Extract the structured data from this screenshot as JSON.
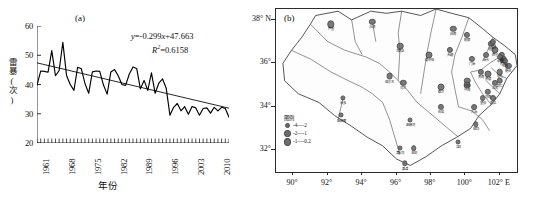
{
  "figure": {
    "panel_a_label": "(a)",
    "panel_b_label": "(b)"
  },
  "chart_data": [
    {
      "type": "line",
      "panel": "(a)",
      "title": "",
      "xlabel": "年份",
      "ylabel": "雷暴(次)",
      "xlim": [
        1961,
        2013
      ],
      "ylim": [
        20,
        60
      ],
      "yticks": [
        20,
        30,
        40,
        50,
        60
      ],
      "xticks": [
        1961,
        1968,
        1975,
        1982,
        1989,
        1996,
        2003,
        2010
      ],
      "grid": false,
      "legend": "none",
      "annotations": [
        {
          "name": "regression-equation",
          "text": "y=-0.299x+47.663"
        },
        {
          "name": "r-squared",
          "text": "R²=0.6158"
        }
      ],
      "trendline": {
        "slope": -0.299,
        "intercept": 47.663,
        "r2": 0.6158,
        "y_at_start": 47.4,
        "y_at_end": 31.9
      },
      "series": [
        {
          "name": "annual thunderstorm days",
          "x": [
            1961,
            1962,
            1963,
            1964,
            1965,
            1966,
            1967,
            1968,
            1969,
            1970,
            1971,
            1972,
            1973,
            1974,
            1975,
            1976,
            1977,
            1978,
            1979,
            1980,
            1981,
            1982,
            1983,
            1984,
            1985,
            1986,
            1987,
            1988,
            1989,
            1990,
            1991,
            1992,
            1993,
            1994,
            1995,
            1996,
            1997,
            1998,
            1999,
            2000,
            2001,
            2002,
            2003,
            2004,
            2005,
            2006,
            2007,
            2008,
            2009,
            2010,
            2011,
            2012,
            2013
          ],
          "values": [
            39.8,
            44.6,
            44.5,
            44.2,
            51.6,
            43.0,
            44.8,
            54.4,
            43.1,
            40.0,
            38.0,
            45.9,
            45.4,
            40.3,
            37.0,
            44.3,
            44.6,
            44.5,
            39.8,
            36.7,
            44.3,
            45.1,
            43.0,
            40.0,
            39.7,
            43.6,
            46.0,
            45.5,
            38.5,
            41.4,
            38.0,
            44.0,
            37.0,
            40.5,
            41.9,
            38.7,
            29.5,
            32.2,
            33.5,
            31.0,
            32.4,
            29.8,
            32.5,
            32.0,
            29.5,
            31.8,
            32.0,
            30.2,
            32.2,
            31.0,
            32.2,
            31.8,
            28.8
          ]
        }
      ]
    },
    {
      "type": "scatter",
      "panel": "(b)",
      "title": "",
      "xlabel": "",
      "ylabel": "",
      "xlim": [
        89,
        103
      ],
      "ylim": [
        31,
        38.5
      ],
      "xticks": [
        "90°",
        "92°",
        "94°",
        "96°",
        "98°",
        "100°",
        "102° E"
      ],
      "yticks": [
        "38° N",
        "36°",
        "34°",
        "32°"
      ],
      "legend_title": "图例",
      "legend_entries": [
        {
          "label": "-4—-2",
          "size": 3.0
        },
        {
          "label": "-2—-1",
          "size": 4.2
        },
        {
          "label": "-1—-0.2",
          "size": 5.8
        }
      ],
      "stations": [
        {
          "label": "芦塞",
          "x": 92.2,
          "y": 37.8,
          "size": 5.4
        },
        {
          "label": "冷湖",
          "x": 94.6,
          "y": 37.9,
          "size": 4.4
        },
        {
          "label": "大柴旦",
          "x": 96.2,
          "y": 36.8,
          "size": 4.6
        },
        {
          "label": "德令哈",
          "x": 97.9,
          "y": 36.4,
          "size": 5.0
        },
        {
          "label": "天峻",
          "x": 99.1,
          "y": 36.6,
          "size": 4.2
        },
        {
          "label": "门源",
          "x": 100.4,
          "y": 36.2,
          "size": 4.2
        },
        {
          "label": "苏南",
          "x": 99.3,
          "y": 37.6,
          "size": 4.4
        },
        {
          "label": "格尔木",
          "x": 95.6,
          "y": 35.4,
          "size": 4.8
        },
        {
          "label": "乌兰",
          "x": 96.4,
          "y": 35.1,
          "size": 4.4
        },
        {
          "label": "都兰",
          "x": 98.6,
          "y": 34.9,
          "size": 5.0
        },
        {
          "label": "共和",
          "x": 100.1,
          "y": 35.2,
          "size": 4.6
        },
        {
          "label": "治多",
          "x": 92.9,
          "y": 34.4,
          "size": 3.2
        },
        {
          "label": "曲麻莱",
          "x": 92.8,
          "y": 33.6,
          "size": 3.0
        },
        {
          "label": "曲麻河",
          "x": 96.8,
          "y": 33.4,
          "size": 3.0
        },
        {
          "label": "清水河",
          "x": 96.2,
          "y": 32.1,
          "size": 3.0
        },
        {
          "label": "玉树",
          "x": 97.0,
          "y": 32.1,
          "size": 3.6
        },
        {
          "label": "囊谦",
          "x": 96.5,
          "y": 31.4,
          "size": 3.4
        },
        {
          "label": "石渠",
          "x": 98.6,
          "y": 34.0,
          "size": 4.2
        },
        {
          "label": "久治",
          "x": 100.5,
          "y": 34.0,
          "size": 3.8
        },
        {
          "label": "班玛",
          "x": 100.6,
          "y": 33.2,
          "size": 3.4
        },
        {
          "label": "达日",
          "x": 99.6,
          "y": 32.4,
          "size": 3.0
        },
        {
          "label": "兴海",
          "x": 100.1,
          "y": 35.0,
          "size": 4.8
        },
        {
          "label": "贵德",
          "x": 101.3,
          "y": 35.5,
          "size": 5.0
        },
        {
          "label": "民和",
          "x": 102.2,
          "y": 36.2,
          "size": 4.6
        },
        {
          "label": "乐都",
          "x": 102.1,
          "y": 36.4,
          "size": 4.4
        },
        {
          "label": "西宁",
          "x": 101.7,
          "y": 36.6,
          "size": 5.2
        },
        {
          "label": "湟中",
          "x": 101.5,
          "y": 36.9,
          "size": 4.4
        },
        {
          "label": "大通",
          "x": 101.6,
          "y": 37.0,
          "size": 4.2
        },
        {
          "label": "平安",
          "x": 102.0,
          "y": 36.3,
          "size": 3.8
        },
        {
          "label": "化隆",
          "x": 102.3,
          "y": 36.1,
          "size": 4.0
        },
        {
          "label": "循化",
          "x": 102.5,
          "y": 35.9,
          "size": 4.2
        },
        {
          "label": "尖扎",
          "x": 102.0,
          "y": 35.6,
          "size": 4.6
        },
        {
          "label": "同仁",
          "x": 102.0,
          "y": 35.2,
          "size": 4.6
        },
        {
          "label": "泽库",
          "x": 101.7,
          "y": 35.1,
          "size": 4.2
        },
        {
          "label": "河南",
          "x": 101.3,
          "y": 34.7,
          "size": 4.4
        },
        {
          "label": "瓪达",
          "x": 101.6,
          "y": 34.4,
          "size": 4.0
        },
        {
          "label": "贵南",
          "x": 100.9,
          "y": 35.6,
          "size": 4.2
        },
        {
          "label": "望谟",
          "x": 101.0,
          "y": 34.4,
          "size": 3.8
        },
        {
          "label": "源头",
          "x": 101.2,
          "y": 36.4,
          "size": 4.0
        },
        {
          "label": "刚察",
          "x": 100.1,
          "y": 37.3,
          "size": 4.2
        }
      ],
      "regions": [
        "芦塞",
        "冷湖",
        "大柴旦",
        "德令哈",
        "天峻",
        "门源",
        "格尔木",
        "乌兰",
        "都兰",
        "共和",
        "治多",
        "曲麻莱",
        "玉树",
        "囊谦",
        "石渠",
        "久治",
        "班玛",
        "达日",
        "兴海",
        "贵德",
        "西宁",
        "湟中",
        "平安",
        "化隆",
        "循化",
        "尖扎",
        "同仁",
        "泽库",
        "河南",
        "瓪达",
        "贵南",
        "刚察"
      ]
    }
  ]
}
